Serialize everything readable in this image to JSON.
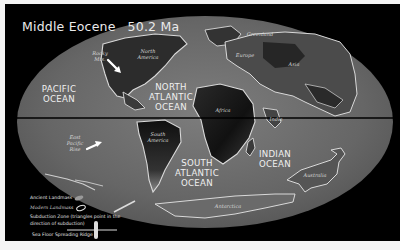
{
  "title": {
    "epoch": "Middle Eocene",
    "age": "50.2 Ma"
  },
  "oceans": {
    "pacific": "PACIFIC OCEAN",
    "north_atlantic": "NORTH ATLANTIC OCEAN",
    "south_atlantic": "SOUTH ATLANTIC OCEAN",
    "indian": "INDIAN OCEAN"
  },
  "places": {
    "rocky_mts": "Rocky Mts.",
    "north_america": "North America",
    "greenland": "Greenland",
    "europe": "Europe",
    "asia": "Asia",
    "africa": "Africa",
    "india": "India",
    "south_america": "South America",
    "east_pacific_rise": "East Pacific Rise",
    "australia": "Australia",
    "antarctica": "Antarctica"
  },
  "legend": {
    "ancient_landmass": "Ancient Landmass",
    "modern_landmass": "Modern Landmass",
    "subduction_zone_line1": "Subduction Zone (triangles point in the",
    "subduction_zone_line2": "direction of subduction)",
    "sea_floor_spreading_ridge": "Sea Floor Spreading Ridge"
  },
  "colors": {
    "background": "#000000",
    "ocean_gray": "#6e6e6e",
    "landmass_dark": "#1c1c1c",
    "coastline": "#d9d9d9",
    "text": "#f0f0f0"
  }
}
